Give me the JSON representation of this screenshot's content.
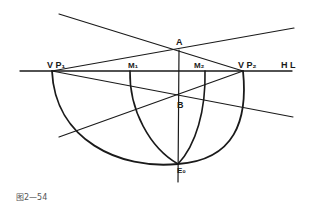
{
  "figure": {
    "caption": "图2—54",
    "stroke_color": "#1a1a1a",
    "labels": {
      "vp1": "V P₁",
      "vp2": "V P₂",
      "hl": "H L",
      "a": "A",
      "b": "B",
      "m1": "M₁",
      "m2": "M₂",
      "e0": "E₀"
    }
  }
}
